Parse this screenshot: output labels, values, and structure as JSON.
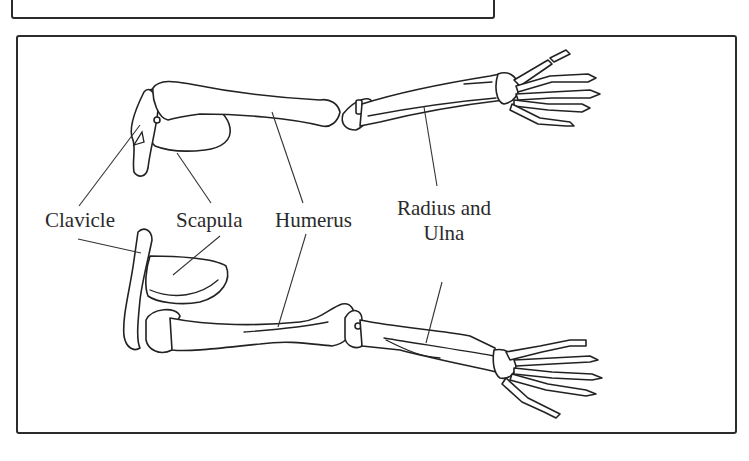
{
  "diagram": {
    "labels": {
      "clavicle": "Clavicle",
      "scapula": "Scapula",
      "humerus": "Humerus",
      "radius_ulna_line1": "Radius and",
      "radius_ulna_line2": "Ulna"
    },
    "views": [
      "upper-arm-view",
      "lower-arm-view"
    ],
    "colors": {
      "line": "#222222",
      "background": "#ffffff",
      "frame": "#2b2b2b"
    }
  }
}
